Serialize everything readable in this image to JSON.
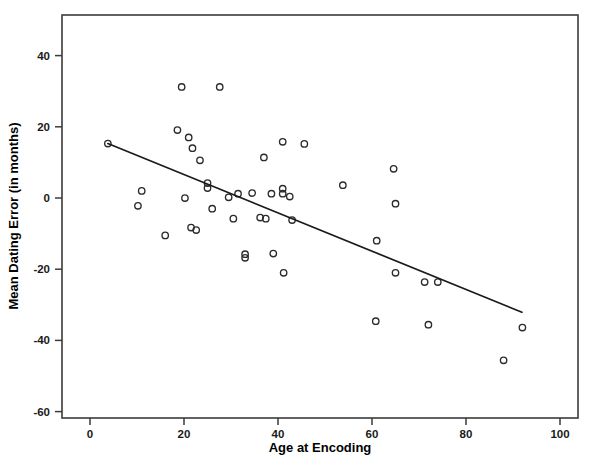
{
  "chart_data": {
    "type": "scatter",
    "title": "",
    "xlabel": "Age at Encoding",
    "ylabel": "Mean Dating Error (in months)",
    "xlim": [
      -6,
      110
    ],
    "ylim": [
      -60,
      53
    ],
    "xticks": [
      0,
      20,
      40,
      60,
      80,
      100
    ],
    "xticklabels": [
      "0",
      "20",
      "40",
      "60",
      "80",
      "100"
    ],
    "yticks": [
      -60,
      -40,
      -20,
      0,
      20,
      40
    ],
    "yticklabels": [
      "-60",
      "-40",
      "-20",
      "0",
      "20",
      "40"
    ],
    "grid": false,
    "legend": null,
    "marker": "open-circle",
    "points": [
      {
        "x": 3.8,
        "y": 15.3
      },
      {
        "x": 11.0,
        "y": 2.0
      },
      {
        "x": 10.2,
        "y": -2.2
      },
      {
        "x": 16.0,
        "y": -10.5
      },
      {
        "x": 18.6,
        "y": 19.1
      },
      {
        "x": 19.5,
        "y": 31.2
      },
      {
        "x": 20.2,
        "y": 0.0
      },
      {
        "x": 21.0,
        "y": 17.0
      },
      {
        "x": 21.5,
        "y": -8.3
      },
      {
        "x": 21.8,
        "y": 14.0
      },
      {
        "x": 23.4,
        "y": 10.6
      },
      {
        "x": 22.6,
        "y": -9.0
      },
      {
        "x": 27.6,
        "y": 31.2
      },
      {
        "x": 25.0,
        "y": 4.2
      },
      {
        "x": 25.0,
        "y": 2.8
      },
      {
        "x": 26.0,
        "y": -3.0
      },
      {
        "x": 29.5,
        "y": 0.2
      },
      {
        "x": 31.5,
        "y": 1.2
      },
      {
        "x": 30.5,
        "y": -5.8
      },
      {
        "x": 33.0,
        "y": -15.8
      },
      {
        "x": 33.0,
        "y": -16.8
      },
      {
        "x": 34.5,
        "y": 1.4
      },
      {
        "x": 36.2,
        "y": -5.5
      },
      {
        "x": 37.4,
        "y": -5.8
      },
      {
        "x": 37.0,
        "y": 11.4
      },
      {
        "x": 38.6,
        "y": 1.2
      },
      {
        "x": 39.0,
        "y": -15.6
      },
      {
        "x": 41.0,
        "y": 2.6
      },
      {
        "x": 41.0,
        "y": 1.2
      },
      {
        "x": 42.5,
        "y": 0.4
      },
      {
        "x": 41.2,
        "y": -21.0
      },
      {
        "x": 41.0,
        "y": 15.8
      },
      {
        "x": 43.0,
        "y": -6.2
      },
      {
        "x": 45.6,
        "y": 15.2
      },
      {
        "x": 53.8,
        "y": 3.6
      },
      {
        "x": 60.8,
        "y": -34.6
      },
      {
        "x": 61.0,
        "y": -12.0
      },
      {
        "x": 64.6,
        "y": 8.2
      },
      {
        "x": 65.0,
        "y": -1.6
      },
      {
        "x": 65.0,
        "y": -21.0
      },
      {
        "x": 71.2,
        "y": -23.6
      },
      {
        "x": 72.0,
        "y": -35.6
      },
      {
        "x": 74.0,
        "y": -23.6
      },
      {
        "x": 88.0,
        "y": -45.6
      },
      {
        "x": 92.0,
        "y": -36.4
      }
    ],
    "fit_line": {
      "label": "linear regression fit",
      "x0": 3.8,
      "y0": 15.3,
      "x1": 91.9,
      "y1": -32.1
    }
  },
  "colors": {
    "marker_stroke": "#2b2b2b",
    "line": "#1a1a1a",
    "frame": "#3b3b3b",
    "background": "#ffffff"
  }
}
